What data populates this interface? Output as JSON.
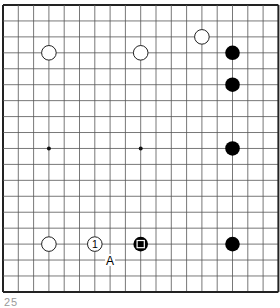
{
  "diagram": {
    "type": "go-board-diagram",
    "board": {
      "lines": 19,
      "origin": {
        "x": 3,
        "y": 5
      },
      "spacing": {
        "x": 15.3,
        "y": 15.94
      },
      "line_color": "#555555",
      "border_color": "#222222",
      "star_points": [
        [
          3,
          9
        ],
        [
          9,
          9
        ]
      ]
    },
    "stones": [
      {
        "color": "white",
        "col": 3,
        "row": 3
      },
      {
        "color": "white",
        "col": 9,
        "row": 3
      },
      {
        "color": "white",
        "col": 13,
        "row": 2
      },
      {
        "color": "black",
        "col": 15,
        "row": 3
      },
      {
        "color": "black",
        "col": 15,
        "row": 5
      },
      {
        "color": "black",
        "col": 15,
        "row": 9
      },
      {
        "color": "white",
        "col": 3,
        "row": 15
      },
      {
        "color": "white",
        "col": 6,
        "row": 15,
        "label": "1"
      },
      {
        "color": "black",
        "col": 9,
        "row": 15,
        "marker": "square"
      },
      {
        "color": "black",
        "col": 15,
        "row": 15
      }
    ],
    "labels": [
      {
        "text": "A",
        "col": 7,
        "row": 16
      }
    ],
    "caption": "25"
  }
}
